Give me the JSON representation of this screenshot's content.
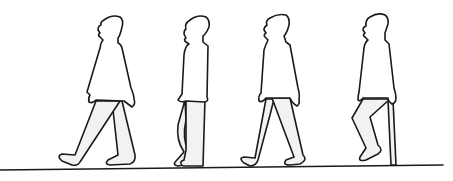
{
  "figure": {
    "description": "Line drawing of four human silhouettes walking left, showing successive phases of a gait cycle along a ground line",
    "figure_count": 4,
    "phases": [
      {
        "index": 1,
        "label": "heel strike / double support (wide stride)"
      },
      {
        "index": 2,
        "label": "mid stance (legs together)"
      },
      {
        "index": 3,
        "label": "double support (stride)"
      },
      {
        "index": 4,
        "label": "swing (knee bent)"
      }
    ],
    "colors": {
      "line": "#1a1a1a",
      "leg_fill": "#f2f2f2",
      "background": "#ffffff"
    }
  }
}
